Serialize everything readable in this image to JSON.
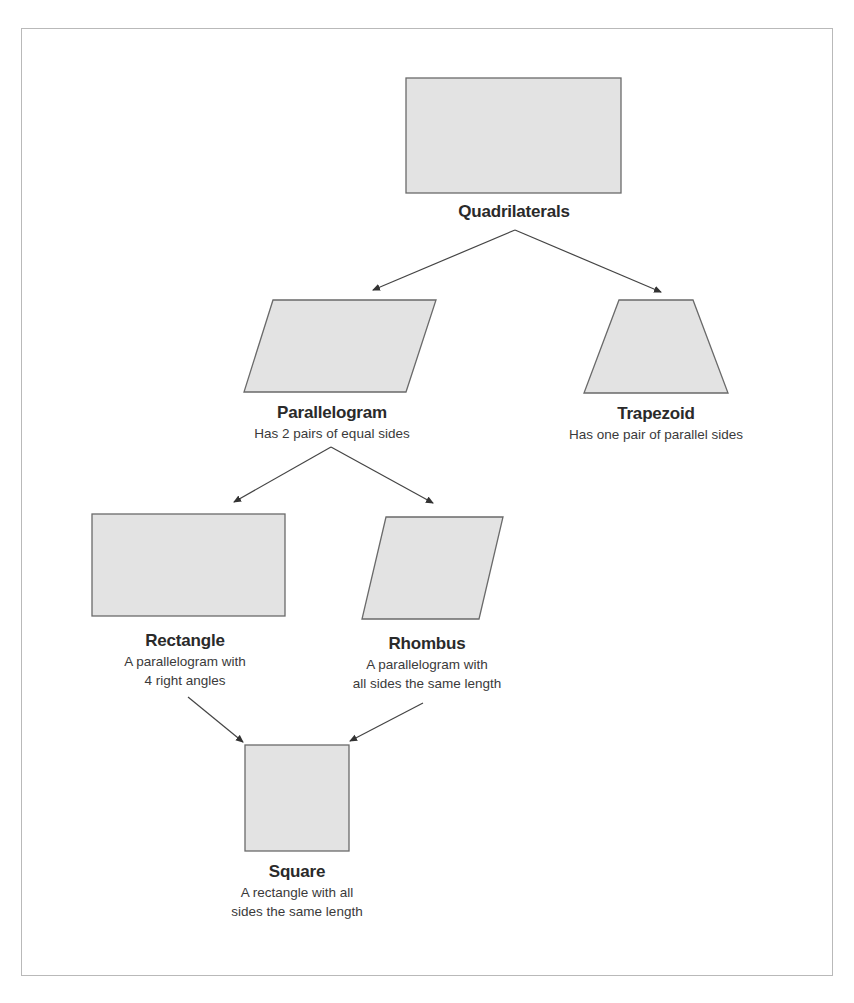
{
  "diagram": {
    "nodes": [
      {
        "id": "quadrilaterals",
        "title": "Quadrilaterals",
        "description_lines": [],
        "shape": "rectangle"
      },
      {
        "id": "parallelogram",
        "title": "Parallelogram",
        "description_lines": [
          "Has 2 pairs of equal sides"
        ],
        "shape": "parallelogram"
      },
      {
        "id": "trapezoid",
        "title": "Trapezoid",
        "description_lines": [
          "Has one pair of parallel sides"
        ],
        "shape": "trapezoid"
      },
      {
        "id": "rectangle",
        "title": "Rectangle",
        "description_lines": [
          "A parallelogram with",
          "4 right angles"
        ],
        "shape": "rectangle"
      },
      {
        "id": "rhombus",
        "title": "Rhombus",
        "description_lines": [
          "A parallelogram with",
          "all sides the same length"
        ],
        "shape": "rhombus"
      },
      {
        "id": "square",
        "title": "Square",
        "description_lines": [
          "A rectangle with all",
          "sides the same length"
        ],
        "shape": "square"
      }
    ],
    "edges": [
      {
        "from": "quadrilaterals",
        "to": "parallelogram"
      },
      {
        "from": "quadrilaterals",
        "to": "trapezoid"
      },
      {
        "from": "parallelogram",
        "to": "rectangle"
      },
      {
        "from": "parallelogram",
        "to": "rhombus"
      },
      {
        "from": "rectangle",
        "to": "square"
      },
      {
        "from": "rhombus",
        "to": "square"
      }
    ],
    "colors": {
      "shape_fill": "#e3e3e3",
      "shape_stroke": "#6a6a6a",
      "arrow": "#444444",
      "frame_border": "#b9b9b9"
    }
  }
}
